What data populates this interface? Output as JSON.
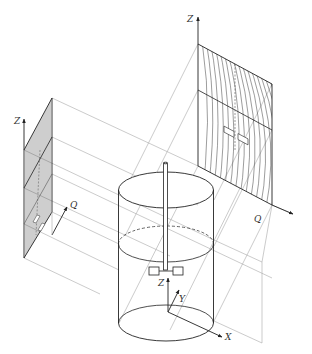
{
  "figure": {
    "type": "isometric projection diagram",
    "colors": {
      "line": "#333333",
      "light_line": "#9a9a9a",
      "background": "#ffffff"
    }
  },
  "labels": {
    "right_panel_z": "Z",
    "right_panel_q": "Q",
    "left_panel_z": "Z",
    "left_panel_q": "Q",
    "tank_z": "Z",
    "tank_y": "Y",
    "tank_x": "X"
  },
  "components": [
    {
      "name": "right-projection-plane",
      "axes": [
        "Z",
        "Q"
      ],
      "content": "curved streamlines with impeller outline"
    },
    {
      "name": "left-projection-plane",
      "axes": [
        "Z",
        "Q"
      ],
      "content": "hatched streamlines with impeller outline"
    },
    {
      "name": "cylindrical-tank",
      "content": "vessel with top ellipse, dashed liquid-level ellipse, bottom ellipse"
    },
    {
      "name": "impeller",
      "content": "central shaft with two-blade paddle"
    },
    {
      "name": "coordinate-axes",
      "axes": [
        "X",
        "Y",
        "Z"
      ]
    }
  ]
}
